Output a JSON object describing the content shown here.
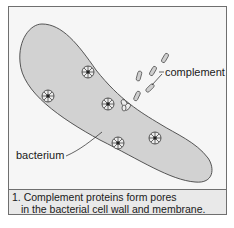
{
  "diagram": {
    "labels": {
      "complement": "complement",
      "bacterium": "bacterium"
    },
    "caption": {
      "line1": "1. Complement proteins form pores",
      "line2": "in the bacterial cell wall and membrane."
    },
    "colors": {
      "background": "#f6f6f6",
      "bacterium_fill": "#d2d2d2",
      "outline": "#444444",
      "caption_bg": "#e9e9e9"
    }
  }
}
